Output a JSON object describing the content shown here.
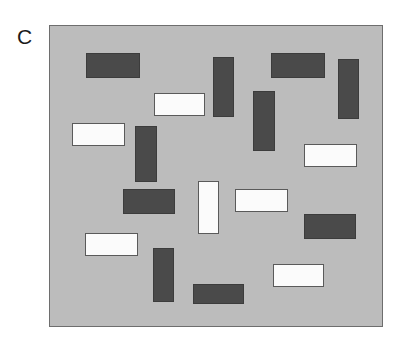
{
  "figure": {
    "panel_letter": "C",
    "background_color": "#ffffff",
    "panel": {
      "fill_color": "#bcbcbc",
      "border_color": "#6e6e6e",
      "x": 49,
      "y": 25,
      "width": 334,
      "height": 302
    },
    "legend": {
      "dark_color": "#4a4a4a",
      "dark_border_color": "#3c3c3c",
      "light_color": "#fbfbfb",
      "light_border_color": "#5a5a5a"
    }
  },
  "chart_data": {
    "type": "scatter",
    "title": "C",
    "subtitle": "",
    "xlabel": "",
    "ylabel": "",
    "grid": false,
    "legend_position": "none",
    "categories": [
      "dark",
      "light"
    ],
    "counts": {
      "dark": 11,
      "light": 9,
      "horizontal": 13,
      "vertical": 7,
      "total": 20
    },
    "xlim": [
      0,
      334
    ],
    "ylim": [
      0,
      302
    ],
    "items": [
      {
        "id": 1,
        "shade": "dark",
        "orientation": "horizontal",
        "x": 36,
        "y": 27,
        "w": 54,
        "h": 25
      },
      {
        "id": 2,
        "shade": "dark",
        "orientation": "vertical",
        "x": 163,
        "y": 31,
        "w": 21,
        "h": 60
      },
      {
        "id": 3,
        "shade": "dark",
        "orientation": "horizontal",
        "x": 221,
        "y": 27,
        "w": 54,
        "h": 25
      },
      {
        "id": 4,
        "shade": "dark",
        "orientation": "vertical",
        "x": 288,
        "y": 33,
        "w": 21,
        "h": 60
      },
      {
        "id": 5,
        "shade": "light",
        "orientation": "horizontal",
        "x": 104,
        "y": 67,
        "w": 51,
        "h": 23
      },
      {
        "id": 6,
        "shade": "dark",
        "orientation": "vertical",
        "x": 203,
        "y": 65,
        "w": 22,
        "h": 60
      },
      {
        "id": 7,
        "shade": "light",
        "orientation": "horizontal",
        "x": 22,
        "y": 97,
        "w": 53,
        "h": 23
      },
      {
        "id": 8,
        "shade": "dark",
        "orientation": "vertical",
        "x": 85,
        "y": 100,
        "w": 22,
        "h": 56
      },
      {
        "id": 9,
        "shade": "light",
        "orientation": "horizontal",
        "x": 254,
        "y": 118,
        "w": 53,
        "h": 23
      },
      {
        "id": 10,
        "shade": "dark",
        "orientation": "horizontal",
        "x": 73,
        "y": 163,
        "w": 52,
        "h": 25
      },
      {
        "id": 11,
        "shade": "light",
        "orientation": "vertical",
        "x": 148,
        "y": 155,
        "w": 21,
        "h": 53
      },
      {
        "id": 12,
        "shade": "light",
        "orientation": "horizontal",
        "x": 185,
        "y": 163,
        "w": 53,
        "h": 23
      },
      {
        "id": 13,
        "shade": "dark",
        "orientation": "horizontal",
        "x": 254,
        "y": 188,
        "w": 52,
        "h": 25
      },
      {
        "id": 14,
        "shade": "light",
        "orientation": "horizontal",
        "x": 35,
        "y": 207,
        "w": 53,
        "h": 23
      },
      {
        "id": 15,
        "shade": "dark",
        "orientation": "vertical",
        "x": 103,
        "y": 222,
        "w": 21,
        "h": 54
      },
      {
        "id": 16,
        "shade": "light",
        "orientation": "horizontal",
        "x": 223,
        "y": 238,
        "w": 51,
        "h": 23
      },
      {
        "id": 17,
        "shade": "dark",
        "orientation": "horizontal",
        "x": 143,
        "y": 258,
        "w": 51,
        "h": 20
      }
    ]
  }
}
